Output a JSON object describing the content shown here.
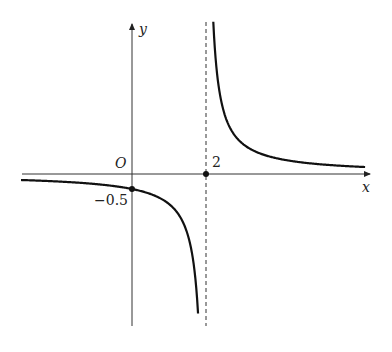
{
  "chart_data": {
    "type": "line",
    "title": "",
    "function": "y = 1/(x - 2)",
    "xlabel": "x",
    "ylabel": "y",
    "origin_label": "O",
    "tick_labels": {
      "x": [
        "2"
      ],
      "y": [
        "-0.5"
      ]
    },
    "asymptotes": {
      "vertical": 2,
      "horizontal": 0
    },
    "marked_points": [
      {
        "x": 0,
        "y": -0.5,
        "label": "-0.5"
      },
      {
        "x": 2,
        "y": 0,
        "label": "2"
      }
    ],
    "series": [
      {
        "name": "left branch",
        "x": [
          -3,
          -2,
          -1,
          0,
          1,
          1.5,
          1.8
        ],
        "values": [
          -0.2,
          -0.25,
          -0.333,
          -0.5,
          -1,
          -2,
          -5
        ]
      },
      {
        "name": "right branch",
        "x": [
          2.2,
          2.5,
          3,
          4,
          5,
          7
        ],
        "values": [
          5,
          2,
          1,
          0.5,
          0.333,
          0.2
        ]
      }
    ],
    "grid": false,
    "legend": "none",
    "xlim": [
      -3,
      6.2
    ],
    "ylim": [
      -5,
      5.5
    ]
  },
  "labels": {
    "x_axis": "x",
    "y_axis": "y",
    "origin": "O",
    "x_tick": "2",
    "y_tick": "−0.5"
  }
}
